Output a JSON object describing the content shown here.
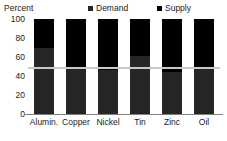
{
  "chart_data": {
    "type": "bar",
    "subtype": "stacked-100",
    "title": "",
    "xlabel": "",
    "ylabel": "Percent",
    "ylim": [
      0,
      100
    ],
    "yticks": [
      0,
      20,
      40,
      60,
      80,
      100
    ],
    "ytick_labels": [
      "0",
      "20",
      "40",
      "60",
      "80",
      "100"
    ],
    "grid": false,
    "legend_position": "top",
    "categories": [
      "Alumin.",
      "Copper",
      "Nickel",
      "Tin",
      "Zinc",
      "Oil"
    ],
    "series": [
      {
        "name": "Demand",
        "color": "#262626",
        "values": [
          70,
          48,
          46,
          61,
          44,
          48
        ]
      },
      {
        "name": "Supply",
        "color": "#000000",
        "values": [
          30,
          52,
          54,
          39,
          56,
          52
        ]
      }
    ],
    "reference_line": {
      "value": 50,
      "color": "#c9c9c9"
    }
  },
  "legend": {
    "entries": [
      {
        "label": "Demand",
        "color": "#262626"
      },
      {
        "label": "Supply",
        "color": "#000000"
      }
    ]
  },
  "axis": {
    "y_title": "Percent"
  }
}
